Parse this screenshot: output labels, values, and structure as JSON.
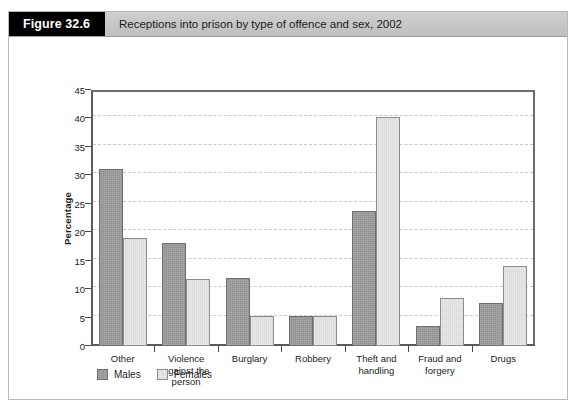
{
  "figure": {
    "number_label": "Figure 32.6",
    "caption": "Receptions into prison by type of offence and sex, 2002"
  },
  "chart_data": {
    "type": "bar",
    "title": "Receptions into prison by type of offence and sex, 2002",
    "xlabel": "",
    "ylabel": "Percentage",
    "ylim": [
      0,
      45
    ],
    "ytick_step": 5,
    "yticks": [
      0,
      5,
      10,
      15,
      20,
      25,
      30,
      35,
      40,
      45
    ],
    "ytick_labels": [
      "0",
      "5",
      "10",
      "15",
      "20",
      "25",
      "30",
      "35",
      "40",
      "45"
    ],
    "grid": true,
    "grid_axis": "y",
    "legend_position": "bottom-left",
    "categories": [
      "Other",
      "Violence against the person",
      "Burglary",
      "Robbery",
      "Theft and handling",
      "Fraud and forgery",
      "Drugs"
    ],
    "category_label_lines": [
      [
        "Other"
      ],
      [
        "Violence",
        "against the",
        "person"
      ],
      [
        "Burglary"
      ],
      [
        "Robbery"
      ],
      [
        "Theft and",
        "handling"
      ],
      [
        "Fraud and",
        "forgery"
      ],
      [
        "Drugs"
      ]
    ],
    "series": [
      {
        "name": "Males",
        "color": "#919191",
        "values": [
          31.1,
          18.1,
          11.9,
          5.2,
          23.7,
          3.5,
          7.5
        ]
      },
      {
        "name": "Females",
        "color": "#d9d9d9",
        "values": [
          19.0,
          11.8,
          5.2,
          5.2,
          40.3,
          8.4,
          14.0
        ]
      }
    ]
  },
  "legend": {
    "items": [
      {
        "label": "Males",
        "key": "males"
      },
      {
        "label": "Females",
        "key": "females"
      }
    ]
  },
  "colors": {
    "males_fill": "#919191",
    "females_fill": "#d9d9d9",
    "header_background": "#c6c6c6",
    "figure_number_background": "#000000",
    "axis_line": "#5a5a5a",
    "gridline": "#c9c9c9"
  }
}
